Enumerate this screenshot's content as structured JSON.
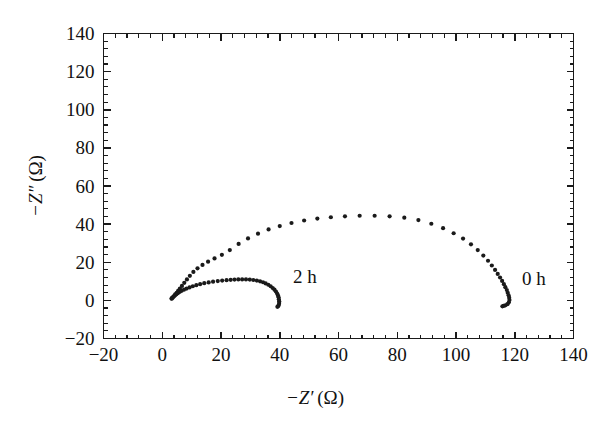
{
  "chart_data": {
    "type": "scatter",
    "title": "",
    "xlabel": "-Z' (Ω)",
    "ylabel": "-Z\" (Ω)",
    "xlabel_parts": {
      "minus": "−",
      "symbol": "Z",
      "prime": "′",
      "unit": "(Ω)"
    },
    "ylabel_parts": {
      "minus": "−",
      "symbol": "Z",
      "prime": "″",
      "unit": "(Ω)"
    },
    "xlim": [
      -20,
      140
    ],
    "ylim": [
      -20,
      140
    ],
    "xticks": [
      -20,
      0,
      20,
      40,
      60,
      80,
      100,
      120,
      140
    ],
    "yticks": [
      -20,
      0,
      20,
      40,
      60,
      80,
      100,
      120,
      140
    ],
    "xticklabels": [
      "−20",
      "0",
      "20",
      "40",
      "60",
      "80",
      "100",
      "120",
      "140"
    ],
    "yticklabels": [
      "−20",
      "0",
      "20",
      "40",
      "60",
      "80",
      "100",
      "120",
      "140"
    ],
    "minor_ticks_per_interval": 4,
    "grid": false,
    "legend_position": "inline-annotations",
    "marker_color": "#1a1a1a",
    "frame_color": "#1a1a1a",
    "background_color": "#ffffff",
    "series": [
      {
        "name": "0 h",
        "label": "0 h",
        "label_x": 122.5,
        "label_y": 11,
        "marker": "dot",
        "points": [
          [
            3.2,
            1.0
          ],
          [
            3.6,
            1.6
          ],
          [
            4.0,
            2.3
          ],
          [
            4.4,
            3.1
          ],
          [
            4.9,
            4.0
          ],
          [
            5.4,
            5.0
          ],
          [
            6.0,
            6.2
          ],
          [
            6.7,
            7.6
          ],
          [
            7.5,
            9.2
          ],
          [
            8.4,
            11.0
          ],
          [
            9.4,
            12.9
          ],
          [
            10.6,
            14.9
          ],
          [
            12.0,
            16.8
          ],
          [
            13.7,
            18.6
          ],
          [
            15.6,
            20.3
          ],
          [
            17.8,
            22.0
          ],
          [
            20.3,
            23.9
          ],
          [
            23.0,
            26.4
          ],
          [
            26.0,
            29.6
          ],
          [
            29.2,
            32.5
          ],
          [
            32.6,
            35.0
          ],
          [
            36.2,
            37.2
          ],
          [
            40.0,
            39.0
          ],
          [
            44.0,
            40.6
          ],
          [
            48.3,
            41.9
          ],
          [
            52.8,
            42.9
          ],
          [
            57.4,
            43.6
          ],
          [
            62.2,
            44.1
          ],
          [
            67.2,
            44.4
          ],
          [
            72.3,
            44.4
          ],
          [
            77.4,
            44.1
          ],
          [
            82.4,
            43.4
          ],
          [
            87.2,
            42.1
          ],
          [
            91.6,
            40.2
          ],
          [
            95.6,
            37.9
          ],
          [
            99.2,
            35.2
          ],
          [
            102.4,
            32.4
          ],
          [
            105.1,
            29.4
          ],
          [
            107.4,
            26.4
          ],
          [
            109.3,
            23.5
          ],
          [
            110.9,
            20.8
          ],
          [
            112.2,
            18.3
          ],
          [
            113.3,
            16.0
          ],
          [
            114.2,
            13.9
          ],
          [
            115.0,
            12.0
          ],
          [
            115.7,
            10.2
          ],
          [
            116.3,
            8.5
          ],
          [
            116.8,
            6.9
          ],
          [
            117.3,
            5.4
          ],
          [
            117.6,
            4.0
          ],
          [
            117.9,
            2.7
          ],
          [
            118.1,
            1.4
          ],
          [
            118.2,
            0.2
          ],
          [
            118.0,
            -1.0
          ],
          [
            117.5,
            -2.0
          ],
          [
            116.8,
            -2.6
          ],
          [
            116.2,
            -2.9
          ],
          [
            115.8,
            -3.1
          ]
        ]
      },
      {
        "name": "2 h",
        "label": "2 h",
        "label_x": 44.5,
        "label_y": 12.5,
        "marker": "dot",
        "points": [
          [
            3.2,
            0.9
          ],
          [
            3.5,
            1.4
          ],
          [
            3.9,
            2.0
          ],
          [
            4.3,
            2.6
          ],
          [
            4.8,
            3.2
          ],
          [
            5.3,
            3.8
          ],
          [
            5.9,
            4.4
          ],
          [
            6.6,
            5.0
          ],
          [
            7.4,
            5.6
          ],
          [
            8.3,
            6.2
          ],
          [
            9.3,
            6.8
          ],
          [
            10.4,
            7.4
          ],
          [
            11.6,
            8.0
          ],
          [
            12.9,
            8.5
          ],
          [
            14.3,
            9.0
          ],
          [
            15.8,
            9.4
          ],
          [
            17.3,
            9.8
          ],
          [
            18.9,
            10.1
          ],
          [
            20.4,
            10.4
          ],
          [
            21.9,
            10.6
          ],
          [
            23.3,
            10.8
          ],
          [
            24.6,
            10.9
          ],
          [
            25.9,
            11.0
          ],
          [
            27.2,
            11.0
          ],
          [
            28.5,
            11.0
          ],
          [
            29.8,
            10.9
          ],
          [
            31.0,
            10.7
          ],
          [
            32.2,
            10.4
          ],
          [
            33.3,
            10.0
          ],
          [
            34.3,
            9.5
          ],
          [
            35.2,
            8.9
          ],
          [
            36.1,
            8.2
          ],
          [
            36.9,
            7.4
          ],
          [
            37.6,
            6.5
          ],
          [
            38.2,
            5.6
          ],
          [
            38.7,
            4.6
          ],
          [
            39.1,
            3.6
          ],
          [
            39.4,
            2.6
          ],
          [
            39.6,
            1.6
          ],
          [
            39.7,
            0.6
          ],
          [
            39.8,
            -0.4
          ],
          [
            39.8,
            -1.4
          ],
          [
            39.7,
            -2.3
          ],
          [
            39.5,
            -3.0
          ],
          [
            39.2,
            -3.4
          ]
        ]
      }
    ]
  },
  "figure": {
    "caption": "",
    "series_annotations": [
      "0 h",
      "2 h"
    ]
  }
}
